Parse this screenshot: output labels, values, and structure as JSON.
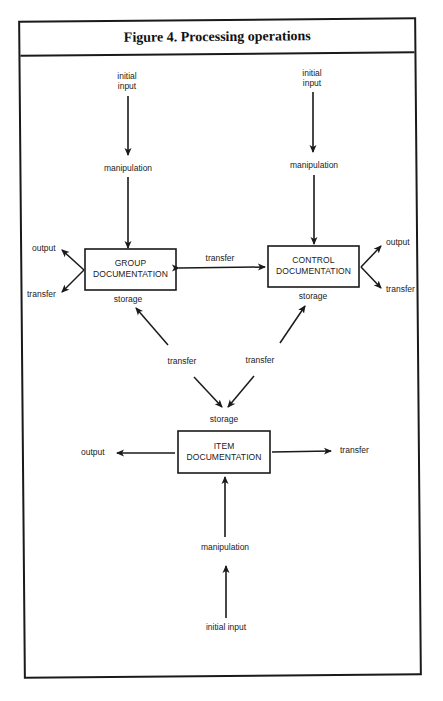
{
  "figure": {
    "title": "Figure 4.  Processing operations"
  },
  "nodes": {
    "group": {
      "line1": "GROUP",
      "line2": "DOCUMENTATION"
    },
    "control": {
      "line1": "CONTROL",
      "line2": "DOCUMENTATION"
    },
    "item": {
      "line1": "ITEM",
      "line2": "DOCUMENTATION"
    }
  },
  "labels": {
    "group_initial_1": "initial",
    "group_initial_2": "input",
    "group_manipulation": "manipulation",
    "group_output": "output",
    "group_transfer": "transfer",
    "group_storage": "storage",
    "control_initial_1": "initial",
    "control_initial_2": "input",
    "control_manipulation": "manipulation",
    "control_output": "output",
    "control_transfer": "transfer",
    "control_storage": "storage",
    "between_transfer": "transfer",
    "left_transfer": "transfer",
    "right_transfer": "transfer",
    "item_storage": "storage",
    "item_output": "output",
    "item_transfer": "transfer",
    "item_manipulation": "manipulation",
    "item_initial_input": "initial input"
  },
  "colors": {
    "ink": "#1a1a1a",
    "background": "#ffffff"
  }
}
